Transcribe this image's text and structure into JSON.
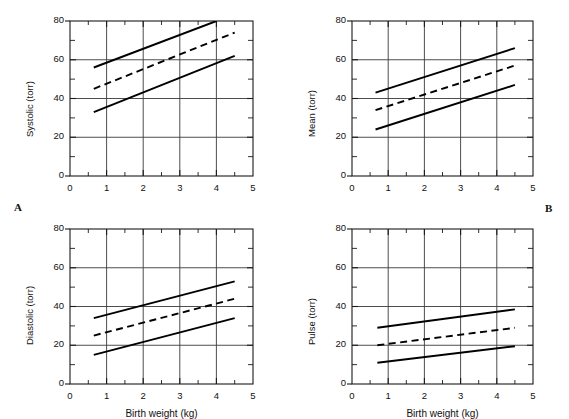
{
  "figure": {
    "panel_labels": [
      {
        "name": "panel-label-a",
        "text": "A"
      },
      {
        "name": "panel-label-b",
        "text": "B"
      }
    ],
    "axis": {
      "x_title": "Birth weight (kg)",
      "x_ticks": [
        "0",
        "1",
        "2",
        "3",
        "4",
        "5"
      ],
      "y_ticks": [
        "0",
        "20",
        "40",
        "60",
        "80"
      ]
    }
  },
  "chart_data": [
    {
      "id": "systolic",
      "type": "line",
      "title": "",
      "xlabel": "",
      "ylabel": "Systolic (torr)",
      "xlim": [
        0,
        5
      ],
      "ylim": [
        0,
        80
      ],
      "xticks": [
        0,
        1,
        2,
        3,
        4,
        5
      ],
      "yticks": [
        0,
        20,
        40,
        60,
        80
      ],
      "xminorticks": [
        0.5,
        1.5,
        2.5,
        3.5,
        4.5
      ],
      "yminorticks": [
        10,
        30,
        50,
        70
      ],
      "grid": true,
      "legend": "none",
      "series": [
        {
          "name": "upper 95% limit",
          "style": "solid",
          "x": [
            0.65,
            4.0
          ],
          "y": [
            56,
            80
          ]
        },
        {
          "name": "mean regression",
          "style": "dashed",
          "x": [
            0.65,
            4.5
          ],
          "y": [
            45,
            74
          ]
        },
        {
          "name": "lower 95% limit",
          "style": "solid",
          "x": [
            0.65,
            4.5
          ],
          "y": [
            33,
            62
          ]
        }
      ]
    },
    {
      "id": "mean",
      "type": "line",
      "title": "",
      "xlabel": "",
      "ylabel": "Mean (torr)",
      "xlim": [
        0,
        5
      ],
      "ylim": [
        0,
        80
      ],
      "xticks": [
        0,
        1,
        2,
        3,
        4,
        5
      ],
      "yticks": [
        0,
        20,
        40,
        60,
        80
      ],
      "xminorticks": [
        0.5,
        1.5,
        2.5,
        3.5,
        4.5
      ],
      "yminorticks": [
        10,
        30,
        50,
        70
      ],
      "grid": true,
      "legend": "none",
      "series": [
        {
          "name": "upper 95% limit",
          "style": "solid",
          "x": [
            0.65,
            4.5
          ],
          "y": [
            43,
            66
          ]
        },
        {
          "name": "mean regression",
          "style": "dashed",
          "x": [
            0.65,
            4.5
          ],
          "y": [
            34,
            57
          ]
        },
        {
          "name": "lower 95% limit",
          "style": "solid",
          "x": [
            0.65,
            4.5
          ],
          "y": [
            24,
            47
          ]
        }
      ]
    },
    {
      "id": "diastolic",
      "type": "line",
      "title": "",
      "xlabel": "Birth weight (kg)",
      "ylabel": "Diastolic (torr)",
      "xlim": [
        0,
        5
      ],
      "ylim": [
        0,
        80
      ],
      "xticks": [
        0,
        1,
        2,
        3,
        4,
        5
      ],
      "yticks": [
        0,
        20,
        40,
        60,
        80
      ],
      "xminorticks": [
        0.5,
        1.5,
        2.5,
        3.5,
        4.5
      ],
      "yminorticks": [
        10,
        30,
        50,
        70
      ],
      "grid": true,
      "legend": "none",
      "series": [
        {
          "name": "upper 95% limit",
          "style": "solid",
          "x": [
            0.65,
            4.5
          ],
          "y": [
            34,
            53
          ]
        },
        {
          "name": "mean regression",
          "style": "dashed",
          "x": [
            0.65,
            4.5
          ],
          "y": [
            25,
            44
          ]
        },
        {
          "name": "lower 95% limit",
          "style": "solid",
          "x": [
            0.65,
            4.5
          ],
          "y": [
            15,
            34
          ]
        }
      ]
    },
    {
      "id": "pulse",
      "type": "line",
      "title": "",
      "xlabel": "Birth weight (kg)",
      "ylabel": "Pulse (torr)",
      "xlim": [
        0,
        5
      ],
      "ylim": [
        0,
        80
      ],
      "xticks": [
        0,
        1,
        2,
        3,
        4,
        5
      ],
      "yticks": [
        0,
        20,
        40,
        60,
        80
      ],
      "xminorticks": [
        0.5,
        1.5,
        2.5,
        3.5,
        4.5
      ],
      "yminorticks": [
        10,
        30,
        50,
        70
      ],
      "grid": true,
      "legend": "none",
      "series": [
        {
          "name": "upper 95% limit",
          "style": "solid",
          "x": [
            0.7,
            4.5
          ],
          "y": [
            29,
            38.5
          ]
        },
        {
          "name": "mean regression",
          "style": "dashed",
          "x": [
            0.7,
            4.5
          ],
          "y": [
            20,
            29
          ]
        },
        {
          "name": "lower 95% limit",
          "style": "solid",
          "x": [
            0.7,
            4.5
          ],
          "y": [
            11,
            19.5
          ]
        }
      ]
    }
  ]
}
